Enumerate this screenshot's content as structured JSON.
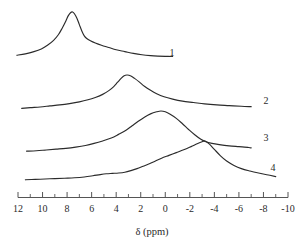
{
  "chart_data": {
    "type": "line",
    "title": "",
    "xlabel": "δ (ppm)",
    "ylabel": "",
    "xlim": [
      12,
      -10
    ],
    "x_axis_reversed": true,
    "grid": false,
    "legend_position": "inline-right",
    "tick_labels": [
      "12",
      "10",
      "8",
      "6",
      "4",
      "2",
      "0",
      "-2",
      "-4",
      "-6",
      "-8",
      "-10"
    ],
    "tick_values": [
      12,
      10,
      8,
      6,
      4,
      2,
      0,
      -2,
      -4,
      -6,
      -8,
      -10
    ],
    "minor_tick_values": [
      11,
      9,
      7,
      5,
      3,
      1,
      -1,
      -3,
      -5,
      -7,
      -9
    ],
    "series": [
      {
        "name": "1",
        "label": "1",
        "peak_ppm": 7.6,
        "description": "sharp narrow resonance near 7.6 ppm with long downfield-to-upfield tail",
        "points": [
          [
            12.1,
            0.04
          ],
          [
            11.4,
            0.07
          ],
          [
            10.7,
            0.12
          ],
          [
            10.1,
            0.18
          ],
          [
            9.6,
            0.26
          ],
          [
            9.1,
            0.37
          ],
          [
            8.7,
            0.5
          ],
          [
            8.4,
            0.64
          ],
          [
            8.1,
            0.8
          ],
          [
            7.9,
            0.92
          ],
          [
            7.7,
            0.99
          ],
          [
            7.55,
            1.0
          ],
          [
            7.4,
            0.96
          ],
          [
            7.2,
            0.86
          ],
          [
            7.0,
            0.72
          ],
          [
            6.8,
            0.58
          ],
          [
            6.6,
            0.47
          ],
          [
            6.4,
            0.41
          ],
          [
            6.1,
            0.36
          ],
          [
            5.7,
            0.31
          ],
          [
            5.2,
            0.26
          ],
          [
            4.6,
            0.21
          ],
          [
            4.0,
            0.16
          ],
          [
            3.3,
            0.12
          ],
          [
            2.6,
            0.08
          ],
          [
            1.9,
            0.05
          ],
          [
            1.2,
            0.03
          ],
          [
            0.6,
            0.02
          ],
          [
            0.0,
            0.015
          ],
          [
            -0.6,
            0.012
          ]
        ]
      },
      {
        "name": "2",
        "label": "2",
        "peak_ppm": 3.3,
        "description": "broad resonance centred near 3.3 ppm",
        "points": [
          [
            11.7,
            0.02
          ],
          [
            11.0,
            0.04
          ],
          [
            10.2,
            0.06
          ],
          [
            9.4,
            0.09
          ],
          [
            8.6,
            0.12
          ],
          [
            7.8,
            0.16
          ],
          [
            7.0,
            0.21
          ],
          [
            6.3,
            0.27
          ],
          [
            5.7,
            0.34
          ],
          [
            5.1,
            0.43
          ],
          [
            4.6,
            0.54
          ],
          [
            4.2,
            0.66
          ],
          [
            3.9,
            0.78
          ],
          [
            3.6,
            0.9
          ],
          [
            3.35,
            0.98
          ],
          [
            3.1,
            1.0
          ],
          [
            2.8,
            0.97
          ],
          [
            2.5,
            0.9
          ],
          [
            2.1,
            0.79
          ],
          [
            1.7,
            0.67
          ],
          [
            1.2,
            0.55
          ],
          [
            0.7,
            0.45
          ],
          [
            0.1,
            0.36
          ],
          [
            -0.6,
            0.29
          ],
          [
            -1.4,
            0.23
          ],
          [
            -2.3,
            0.19
          ],
          [
            -3.2,
            0.15
          ],
          [
            -4.2,
            0.12
          ],
          [
            -5.2,
            0.1
          ],
          [
            -6.2,
            0.08
          ],
          [
            -7.0,
            0.07
          ]
        ]
      },
      {
        "name": "3",
        "label": "3",
        "peak_ppm": 0.4,
        "description": "broad resonance centred near 0.4 ppm, crossing trace 4 near -3 ppm",
        "points": [
          [
            11.3,
            0.02
          ],
          [
            10.5,
            0.03
          ],
          [
            9.7,
            0.05
          ],
          [
            8.9,
            0.07
          ],
          [
            8.1,
            0.09
          ],
          [
            7.3,
            0.12
          ],
          [
            6.5,
            0.16
          ],
          [
            5.8,
            0.21
          ],
          [
            5.1,
            0.27
          ],
          [
            4.4,
            0.34
          ],
          [
            3.8,
            0.43
          ],
          [
            3.2,
            0.53
          ],
          [
            2.7,
            0.64
          ],
          [
            2.2,
            0.75
          ],
          [
            1.7,
            0.85
          ],
          [
            1.2,
            0.93
          ],
          [
            0.7,
            0.98
          ],
          [
            0.35,
            1.0
          ],
          [
            0.0,
            0.98
          ],
          [
            -0.4,
            0.92
          ],
          [
            -0.9,
            0.82
          ],
          [
            -1.4,
            0.69
          ],
          [
            -1.9,
            0.55
          ],
          [
            -2.4,
            0.42
          ],
          [
            -2.9,
            0.31
          ],
          [
            -3.3,
            0.25
          ],
          [
            -3.8,
            0.21
          ],
          [
            -4.4,
            0.18
          ],
          [
            -5.2,
            0.15
          ],
          [
            -6.0,
            0.13
          ],
          [
            -6.8,
            0.11
          ],
          [
            -7.0,
            0.1
          ]
        ]
      },
      {
        "name": "4",
        "label": "4",
        "peak_ppm": -3.2,
        "description": "sharp resonance near -3.2 ppm with steep upfield decay",
        "points": [
          [
            11.4,
            0.03
          ],
          [
            10.6,
            0.04
          ],
          [
            9.8,
            0.05
          ],
          [
            9.0,
            0.06
          ],
          [
            8.2,
            0.07
          ],
          [
            7.4,
            0.08
          ],
          [
            6.6,
            0.1
          ],
          [
            5.9,
            0.13
          ],
          [
            5.3,
            0.16
          ],
          [
            4.8,
            0.18
          ],
          [
            4.3,
            0.19
          ],
          [
            3.8,
            0.2
          ],
          [
            3.3,
            0.22
          ],
          [
            2.8,
            0.26
          ],
          [
            2.3,
            0.31
          ],
          [
            1.8,
            0.37
          ],
          [
            1.3,
            0.43
          ],
          [
            0.8,
            0.5
          ],
          [
            0.3,
            0.57
          ],
          [
            -0.3,
            0.64
          ],
          [
            -0.9,
            0.71
          ],
          [
            -1.5,
            0.78
          ],
          [
            -2.1,
            0.86
          ],
          [
            -2.6,
            0.93
          ],
          [
            -3.0,
            0.98
          ],
          [
            -3.25,
            1.0
          ],
          [
            -3.6,
            0.92
          ],
          [
            -4.0,
            0.79
          ],
          [
            -4.5,
            0.63
          ],
          [
            -5.0,
            0.5
          ],
          [
            -5.6,
            0.39
          ],
          [
            -6.2,
            0.31
          ],
          [
            -6.9,
            0.25
          ],
          [
            -7.6,
            0.2
          ],
          [
            -8.4,
            0.15
          ],
          [
            -9.0,
            0.11
          ]
        ]
      }
    ]
  },
  "labels": {
    "trace_1": "1",
    "trace_2": "2",
    "trace_3": "3",
    "trace_4": "4",
    "axis_title": "δ (ppm)"
  },
  "ticks": {
    "t0": "12",
    "t1": "10",
    "t2": "8",
    "t3": "6",
    "t4": "4",
    "t5": "2",
    "t6": "0",
    "t7": "-2",
    "t8": "-4",
    "t9": "-6",
    "t10": "-8",
    "t11": "-10"
  },
  "colors": {
    "trace": "#2b2b2b",
    "axis": "#555555",
    "background": "#ffffff"
  }
}
